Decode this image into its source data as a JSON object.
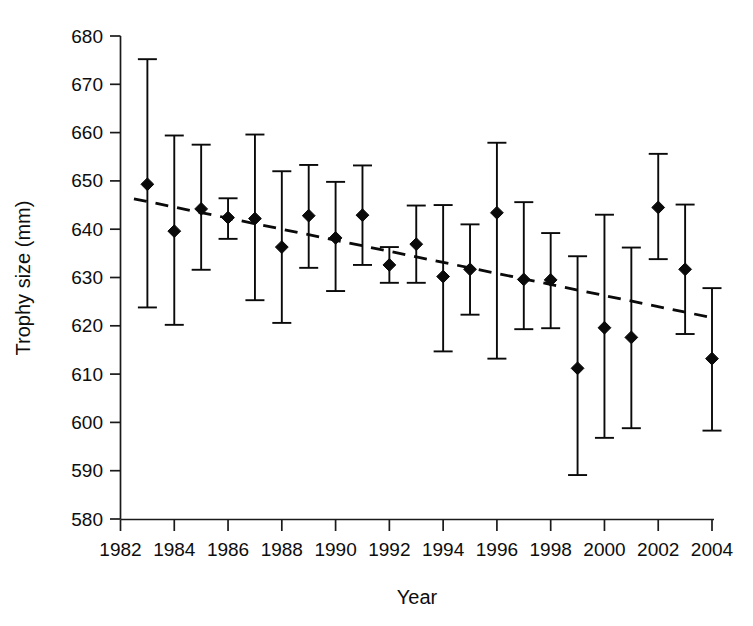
{
  "chart_data": {
    "type": "scatter",
    "title": "",
    "subtitle": "",
    "xlabel": "Year",
    "ylabel": "Trophy size (mm)",
    "xlim": [
      1982,
      2004
    ],
    "ylim": [
      580,
      680
    ],
    "grid": false,
    "legend": null,
    "x_ticks": [
      1982,
      1984,
      1986,
      1988,
      1990,
      1992,
      1994,
      1996,
      1998,
      2000,
      2002,
      2004
    ],
    "x_tick_labels": [
      "1982",
      "1984",
      "1986",
      "1988",
      "1990",
      "1992",
      "1994",
      "1996",
      "1998",
      "2000",
      "2002",
      "2004"
    ],
    "x_minor_ticks": [
      1983,
      1985,
      1987,
      1989,
      1991,
      1993,
      1995,
      1997,
      1999,
      2001,
      2003
    ],
    "y_ticks": [
      580,
      590,
      600,
      610,
      620,
      630,
      640,
      650,
      660,
      670,
      680
    ],
    "y_tick_labels": [
      "580",
      "590",
      "600",
      "610",
      "620",
      "630",
      "640",
      "650",
      "660",
      "670",
      "680"
    ],
    "marker_style": "filled-diamond",
    "error_bar_style": "capped-vertical",
    "series": [
      {
        "name": "Mean trophy size with 95% CI",
        "x": [
          1983,
          1984,
          1985,
          1986,
          1987,
          1988,
          1989,
          1990,
          1991,
          1992,
          1993,
          1994,
          1995,
          1996,
          1997,
          1998,
          1999,
          2000,
          2001,
          2002,
          2003,
          2004
        ],
        "values": [
          649.3,
          639.6,
          644.2,
          642.4,
          642.2,
          636.3,
          642.8,
          638.2,
          642.9,
          632.6,
          636.9,
          630.2,
          631.7,
          643.4,
          629.6,
          629.5,
          611.2,
          619.6,
          617.6,
          644.5,
          631.7,
          613.2
        ],
        "err_low": [
          623.8,
          620.2,
          631.6,
          638.0,
          625.3,
          620.6,
          632.0,
          627.2,
          632.6,
          628.9,
          628.9,
          614.7,
          622.3,
          613.2,
          619.3,
          619.5,
          589.1,
          596.8,
          598.8,
          633.8,
          618.3,
          598.3
        ],
        "err_high": [
          675.2,
          659.4,
          657.5,
          646.4,
          659.6,
          652.0,
          653.3,
          649.8,
          653.2,
          636.3,
          644.9,
          645.0,
          641.0,
          657.9,
          645.6,
          639.2,
          634.4,
          643.0,
          636.2,
          655.6,
          645.1,
          627.8
        ]
      }
    ],
    "trendline": {
      "name": "linear-regression-dashed",
      "style": "dashed",
      "x_start": 1982.5,
      "x_end": 2003.9,
      "y_start": 646.3,
      "y_end": 621.8
    }
  },
  "axis": {
    "x_title": "Year",
    "y_title": "Trophy size (mm)"
  }
}
